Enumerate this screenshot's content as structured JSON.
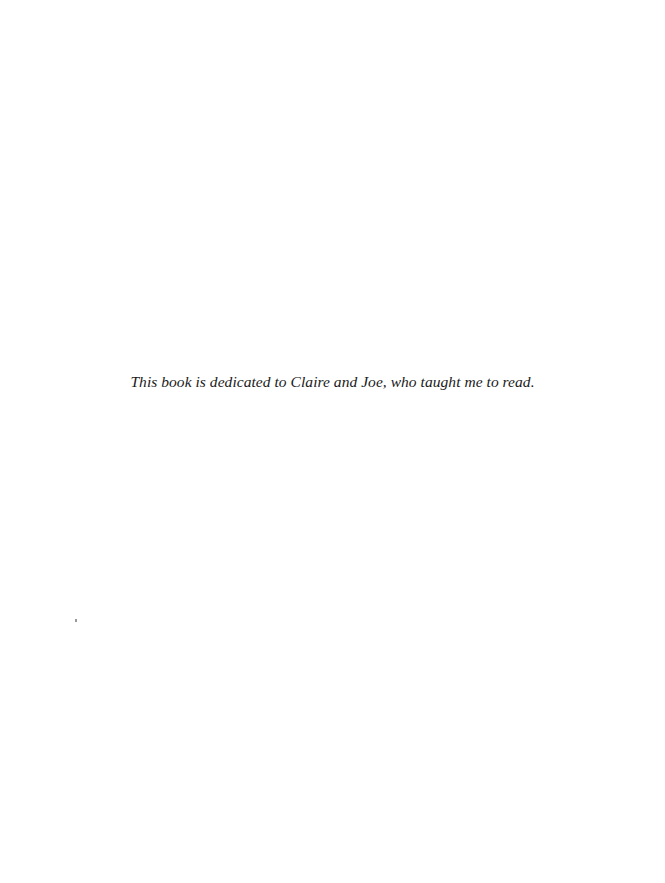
{
  "page": {
    "dedication": "This book is dedicated to Claire and Joe, who taught me to read."
  }
}
